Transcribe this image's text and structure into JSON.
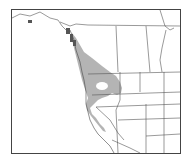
{
  "map": {
    "type": "species range map",
    "region": "Western North America",
    "colors": {
      "background": "#ffffff",
      "range_fill": "#b4b4b4",
      "border_line": "#555555",
      "frame": "#444444"
    },
    "legend": null
  }
}
